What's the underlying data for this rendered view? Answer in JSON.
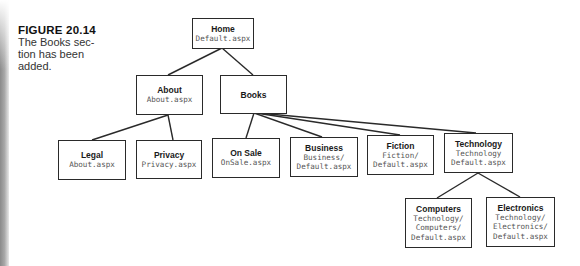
{
  "caption": {
    "figure_label": "FIGURE 20.14",
    "text": "The Books section has been added.",
    "text_lines": [
      "The Books sec-",
      "tion has been",
      "added."
    ]
  },
  "colors": {
    "box_border": "#2a2a2a",
    "title_text": "#1a1a1a",
    "file_text": "#555555",
    "background": "#ffffff"
  },
  "nodes": {
    "home": {
      "title": "Home",
      "file_lines": [
        "Default.aspx"
      ]
    },
    "about": {
      "title": "About",
      "file_lines": [
        "About.aspx"
      ]
    },
    "books": {
      "title": "Books",
      "file_lines": []
    },
    "legal": {
      "title": "Legal",
      "file_lines": [
        "About.aspx"
      ]
    },
    "privacy": {
      "title": "Privacy",
      "file_lines": [
        "Privacy.aspx"
      ]
    },
    "onsale": {
      "title": "On Sale",
      "file_lines": [
        "OnSale.aspx"
      ]
    },
    "business": {
      "title": "Business",
      "file_lines": [
        "Business/",
        "Default.aspx"
      ]
    },
    "fiction": {
      "title": "Fiction",
      "file_lines": [
        "Fiction/",
        "Default.aspx"
      ]
    },
    "technology": {
      "title": "Technology",
      "file_lines": [
        "Technology",
        "Default.aspx"
      ]
    },
    "computers": {
      "title": "Computers",
      "file_lines": [
        "Technology/",
        "Computers/",
        "Default.aspx"
      ]
    },
    "electronics": {
      "title": "Electronics",
      "file_lines": [
        "Technology/",
        "Electronics/",
        "Default.aspx"
      ]
    }
  },
  "edges": [
    [
      "home",
      "about"
    ],
    [
      "home",
      "books"
    ],
    [
      "about",
      "legal"
    ],
    [
      "about",
      "privacy"
    ],
    [
      "books",
      "onsale"
    ],
    [
      "books",
      "business"
    ],
    [
      "books",
      "fiction"
    ],
    [
      "books",
      "technology"
    ],
    [
      "technology",
      "computers"
    ],
    [
      "technology",
      "electronics"
    ]
  ]
}
